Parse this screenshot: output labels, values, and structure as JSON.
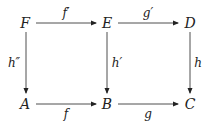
{
  "diagram": {
    "type": "commutative-diagram",
    "nodes": [
      {
        "id": "F",
        "label": "F"
      },
      {
        "id": "E",
        "label": "E"
      },
      {
        "id": "D",
        "label": "D"
      },
      {
        "id": "A",
        "label": "A"
      },
      {
        "id": "B",
        "label": "B"
      },
      {
        "id": "C",
        "label": "C"
      }
    ],
    "arrows": [
      {
        "from": "F",
        "to": "E",
        "label": "f′"
      },
      {
        "from": "E",
        "to": "D",
        "label": "g′"
      },
      {
        "from": "F",
        "to": "A",
        "label": "h″"
      },
      {
        "from": "E",
        "to": "B",
        "label": "h′"
      },
      {
        "from": "D",
        "to": "C",
        "label": "h"
      },
      {
        "from": "A",
        "to": "B",
        "label": "f"
      },
      {
        "from": "B",
        "to": "C",
        "label": "g"
      }
    ],
    "colors": {
      "ink": "#222222",
      "background": "#ffffff"
    }
  }
}
